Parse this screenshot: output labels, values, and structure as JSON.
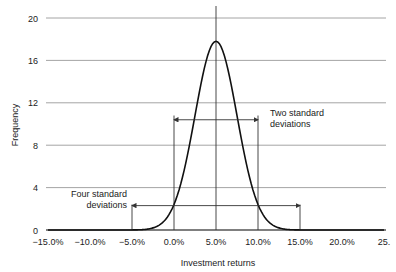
{
  "chart_data": {
    "type": "line",
    "title": "",
    "xlabel": "Investment returns",
    "ylabel": "Frequency",
    "xlim": [
      -15.0,
      25.0
    ],
    "ylim": [
      0,
      20
    ],
    "grid": {
      "horizontal": true,
      "vertical": false
    },
    "x_tick_labels": [
      "−15.0%",
      "−10.0%",
      "−5.0%",
      "0.0%",
      "5.0%",
      "10.0%",
      "15.0%",
      "20.0%",
      "25."
    ],
    "x_ticks": [
      -15,
      -10,
      -5,
      0,
      5,
      10,
      15,
      20,
      25
    ],
    "y_ticks": [
      0,
      4,
      8,
      12,
      16,
      20
    ],
    "y_tick_labels": [
      "0",
      "4",
      "8",
      "12",
      "16",
      "20"
    ],
    "series": [
      {
        "name": "Normal distribution of returns",
        "mean": 5.0,
        "std_dev": 2.5,
        "peak": 17.8,
        "x": [
          -15,
          -12.5,
          -10,
          -7.5,
          -5,
          -2.5,
          0,
          2.5,
          5,
          7.5,
          10,
          12.5,
          15,
          17.5,
          20,
          22.5,
          25
        ],
        "values": [
          0.0,
          0.05,
          0.2,
          0.7,
          2.4,
          5.8,
          10.8,
          15.8,
          17.8,
          15.8,
          10.8,
          5.8,
          2.4,
          0.7,
          0.2,
          0.05,
          0.0
        ]
      }
    ],
    "vertical_lines": [
      {
        "x": -5,
        "y_top": 2.4
      },
      {
        "x": 0,
        "y_top": 10.8
      },
      {
        "x": 5,
        "y_top": 20
      },
      {
        "x": 10,
        "y_top": 10.8
      },
      {
        "x": 15,
        "y_top": 2.4
      }
    ],
    "annotations": [
      {
        "text_lines": [
          "Two standard",
          "deviations"
        ],
        "arrow_from": 0,
        "arrow_to": 10,
        "y": 10.4
      },
      {
        "text_lines": [
          "Four standard",
          "deviations"
        ],
        "arrow_from": -5,
        "arrow_to": 15,
        "y": 2.3
      }
    ]
  },
  "labels": {
    "xlabel": "Investment returns",
    "ylabel": "Frequency",
    "annotation_two_line1": "Two standard",
    "annotation_two_line2": "deviations",
    "annotation_four_line1": "Four standard",
    "annotation_four_line2": "deviations"
  }
}
